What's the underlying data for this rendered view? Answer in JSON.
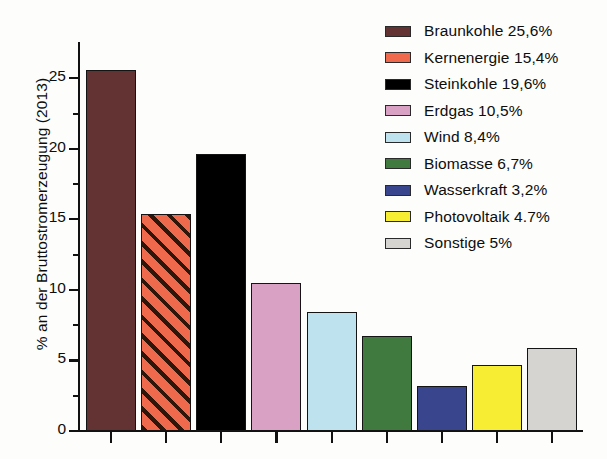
{
  "chart_data": {
    "type": "bar",
    "title": "",
    "xlabel": "",
    "ylabel": "% an der Bruttostromerzeugung (2013)",
    "ylim": [
      0,
      27.5
    ],
    "xtick_labels": [],
    "ytick_labels": [
      "0",
      "5",
      "10",
      "15",
      "20",
      "25"
    ],
    "ytick_values": [
      0,
      5,
      10,
      15,
      20,
      25
    ],
    "yminor_values": [
      2.5,
      7.5,
      12.5,
      17.5,
      22.5
    ],
    "grid": false,
    "legend_position": "top-right",
    "categories": [
      "Braunkohle",
      "Kernenergie",
      "Steinkohle",
      "Erdgas",
      "Wind",
      "Biomasse",
      "Wasserkraft",
      "Photovoltaik",
      "Sonstige"
    ],
    "values": [
      25.6,
      15.4,
      19.6,
      10.5,
      8.4,
      6.7,
      3.2,
      4.7,
      5.85
    ],
    "bars": [
      {
        "category": "Braunkohle",
        "value": 25.6,
        "color": "#633334",
        "pattern": "solid"
      },
      {
        "category": "Kernenergie",
        "value": 15.4,
        "color": "#ef6a4c",
        "pattern": "diagonal-hatch"
      },
      {
        "category": "Steinkohle",
        "value": 19.6,
        "color": "#000000",
        "pattern": "solid"
      },
      {
        "category": "Erdgas",
        "value": 10.5,
        "color": "#d9a2c4",
        "pattern": "solid"
      },
      {
        "category": "Wind",
        "value": 8.4,
        "color": "#bfe2ef",
        "pattern": "solid"
      },
      {
        "category": "Biomasse",
        "value": 6.7,
        "color": "#417a3e",
        "pattern": "solid"
      },
      {
        "category": "Wasserkraft",
        "value": 3.2,
        "color": "#39458c",
        "pattern": "solid"
      },
      {
        "category": "Photovoltaik",
        "value": 4.7,
        "color": "#f7ed33",
        "pattern": "solid"
      },
      {
        "category": "Sonstige",
        "value": 5.85,
        "color": "#d5d4d0",
        "pattern": "solid"
      }
    ],
    "legend": [
      {
        "label": "Braunkohle 25,6%",
        "color": "#633334",
        "pattern": "solid"
      },
      {
        "label": "Kernenergie 15,4%",
        "color": "#ef6a4c",
        "pattern": "solid"
      },
      {
        "label": "Steinkohle 19,6%",
        "color": "#000000",
        "pattern": "solid"
      },
      {
        "label": "Erdgas 10,5%",
        "color": "#d9a2c4",
        "pattern": "solid"
      },
      {
        "label": "Wind 8,4%",
        "color": "#bfe2ef",
        "pattern": "solid"
      },
      {
        "label": "Biomasse 6,7%",
        "color": "#417a3e",
        "pattern": "solid"
      },
      {
        "label": "Wasserkraft 3,2%",
        "color": "#39458c",
        "pattern": "solid"
      },
      {
        "label": "Photovoltaik 4.7%",
        "color": "#f7ed33",
        "pattern": "solid"
      },
      {
        "label": "Sonstige 5%",
        "color": "#d5d4d0",
        "pattern": "solid"
      }
    ]
  }
}
